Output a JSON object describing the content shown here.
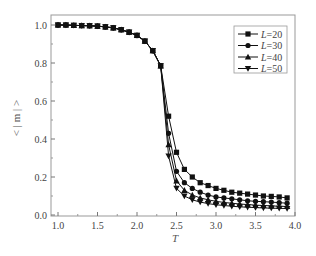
{
  "chart_data": {
    "type": "line",
    "title": "",
    "xlabel": "T",
    "ylabel": "< | m | >",
    "xlim": [
      0.95,
      4.05
    ],
    "ylim": [
      -0.02,
      1.05
    ],
    "xticks": [
      1.0,
      1.5,
      2.0,
      2.5,
      3.0,
      3.5,
      4.0
    ],
    "xtick_labels": [
      "1.0",
      "1.5",
      "2.0",
      "2.5",
      "3.0",
      "3.5",
      "4.0"
    ],
    "yticks": [
      0.0,
      0.2,
      0.4,
      0.6,
      0.8,
      1.0
    ],
    "ytick_labels": [
      "0.0",
      "0.2",
      "0.4",
      "0.6",
      "0.8",
      "1.0"
    ],
    "grid": false,
    "legend_position": "upper right",
    "x": [
      1.0,
      1.1,
      1.2,
      1.3,
      1.4,
      1.5,
      1.6,
      1.7,
      1.8,
      1.9,
      2.0,
      2.1,
      2.2,
      2.3,
      2.4,
      2.5,
      2.6,
      2.7,
      2.8,
      2.9,
      3.0,
      3.1,
      3.2,
      3.3,
      3.4,
      3.5,
      3.6,
      3.7,
      3.8,
      3.9
    ],
    "series": [
      {
        "name": "L=20",
        "marker": "square",
        "values": [
          1.0,
          1.0,
          0.998,
          0.997,
          0.996,
          0.994,
          0.99,
          0.985,
          0.975,
          0.962,
          0.945,
          0.915,
          0.865,
          0.785,
          0.52,
          0.33,
          0.24,
          0.2,
          0.17,
          0.155,
          0.14,
          0.13,
          0.12,
          0.115,
          0.11,
          0.105,
          0.1,
          0.098,
          0.095,
          0.09
        ]
      },
      {
        "name": "L=30",
        "marker": "circle",
        "values": [
          1.0,
          1.0,
          0.998,
          0.997,
          0.996,
          0.994,
          0.99,
          0.985,
          0.975,
          0.962,
          0.945,
          0.915,
          0.865,
          0.785,
          0.43,
          0.23,
          0.17,
          0.14,
          0.12,
          0.105,
          0.095,
          0.09,
          0.085,
          0.08,
          0.075,
          0.072,
          0.07,
          0.068,
          0.065,
          0.062
        ]
      },
      {
        "name": "L=40",
        "marker": "triangle-up",
        "values": [
          1.0,
          1.0,
          0.998,
          0.997,
          0.996,
          0.994,
          0.99,
          0.985,
          0.975,
          0.962,
          0.945,
          0.915,
          0.865,
          0.785,
          0.37,
          0.18,
          0.13,
          0.105,
          0.09,
          0.08,
          0.072,
          0.066,
          0.062,
          0.058,
          0.055,
          0.052,
          0.05,
          0.048,
          0.046,
          0.045
        ]
      },
      {
        "name": "L=50",
        "marker": "triangle-down",
        "values": [
          1.0,
          1.0,
          0.998,
          0.997,
          0.996,
          0.994,
          0.99,
          0.985,
          0.975,
          0.962,
          0.945,
          0.915,
          0.865,
          0.785,
          0.31,
          0.14,
          0.1,
          0.08,
          0.068,
          0.06,
          0.054,
          0.05,
          0.046,
          0.043,
          0.041,
          0.039,
          0.037,
          0.036,
          0.035,
          0.034
        ]
      }
    ]
  },
  "legend": {
    "items": [
      {
        "label": "L=20",
        "marker": "square"
      },
      {
        "label": "L=30",
        "marker": "circle"
      },
      {
        "label": "L=40",
        "marker": "triangle-up"
      },
      {
        "label": "L=50",
        "marker": "triangle-down"
      }
    ]
  },
  "axes": {
    "xlabel": "T",
    "ylabel": "< | m | >"
  },
  "colors": {
    "line": "#111111",
    "frame": "#888888",
    "text": "#444444"
  }
}
